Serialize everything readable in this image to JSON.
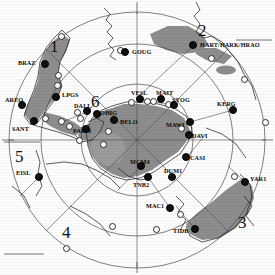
{
  "map": {
    "title": "Antarctic polar projection station map",
    "projection": "south-polar",
    "colors": {
      "plate_fill": "#8a8a8a",
      "plate_fill_light": "#9b9b9b",
      "coastline": "#2b2b2b",
      "graticule": "#555555",
      "station_filled": "#101010",
      "station_hollow": "#ffffff",
      "background": "#ffffff"
    },
    "region_numbers": [
      {
        "label": "1",
        "x": 50,
        "y": 38
      },
      {
        "label": "2",
        "x": 198,
        "y": 22
      },
      {
        "label": "3",
        "x": 238,
        "y": 214
      },
      {
        "label": "4",
        "x": 62,
        "y": 224
      },
      {
        "label": "5",
        "x": 15,
        "y": 148
      },
      {
        "label": "6",
        "x": 91,
        "y": 93
      }
    ],
    "stations": [
      {
        "name": "BRAZ",
        "x": 45,
        "y": 64,
        "type": "filled",
        "label_x": 18,
        "label_y": 60
      },
      {
        "name": "AREQ",
        "x": 22,
        "y": 105,
        "type": "filled",
        "label_x": 5,
        "label_y": 97
      },
      {
        "name": "SANT",
        "x": 34,
        "y": 121,
        "type": "filled",
        "label_x": 12,
        "label_y": 126
      },
      {
        "name": "LPGS",
        "x": 56,
        "y": 97,
        "type": "filled",
        "label_x": 62,
        "label_y": 92
      },
      {
        "name": "EISL",
        "x": 39,
        "y": 177,
        "type": "filled",
        "label_x": 16,
        "label_y": 170
      },
      {
        "name": "GOUG",
        "x": 125,
        "y": 52,
        "type": "filled",
        "label_x": 132,
        "label_y": 49
      },
      {
        "name": "HART/HARK/HRAO",
        "x": 193,
        "y": 45,
        "type": "filled",
        "label_x": 200,
        "label_y": 42
      },
      {
        "name": "KERG",
        "x": 233,
        "y": 110,
        "type": "filled",
        "label_x": 217,
        "label_y": 101
      },
      {
        "name": "VESL",
        "x": 140,
        "y": 99,
        "type": "filled",
        "label_x": 131,
        "label_y": 90
      },
      {
        "name": "MAIT",
        "x": 161,
        "y": 99,
        "type": "filled",
        "label_x": 156,
        "label_y": 90
      },
      {
        "name": "SYOG",
        "x": 174,
        "y": 105,
        "type": "filled",
        "label_x": 172,
        "label_y": 97
      },
      {
        "name": "MAWI",
        "x": 190,
        "y": 122,
        "type": "filled",
        "label_x": 166,
        "label_y": 122
      },
      {
        "name": "DAVI",
        "x": 189,
        "y": 135,
        "type": "filled",
        "label_x": 192,
        "label_y": 133
      },
      {
        "name": "BELO",
        "x": 114,
        "y": 120,
        "type": "filled",
        "label_x": 120,
        "label_y": 119
      },
      {
        "name": "DALL",
        "x": 87,
        "y": 111,
        "type": "filled",
        "label_x": 74,
        "label_y": 103
      },
      {
        "name": "OHIG",
        "x": 97,
        "y": 114,
        "type": "filled",
        "label_x": 100,
        "label_y": 110
      },
      {
        "name": "PALM",
        "x": 86,
        "y": 129,
        "type": "filled",
        "label_x": 73,
        "label_y": 128
      },
      {
        "name": "MCM4",
        "x": 141,
        "y": 166,
        "type": "filled",
        "label_x": 130,
        "label_y": 159
      },
      {
        "name": "TNB2",
        "x": 148,
        "y": 177,
        "type": "filled",
        "label_x": 133,
        "label_y": 182
      },
      {
        "name": "DUM1",
        "x": 172,
        "y": 177,
        "type": "filled",
        "label_x": 164,
        "label_y": 168
      },
      {
        "name": "CASI",
        "x": 186,
        "y": 157,
        "type": "filled",
        "label_x": 190,
        "label_y": 155
      },
      {
        "name": "MAC1",
        "x": 170,
        "y": 208,
        "type": "filled",
        "label_x": 146,
        "label_y": 203
      },
      {
        "name": "TIDB",
        "x": 195,
        "y": 229,
        "type": "filled",
        "label_x": 173,
        "label_y": 228
      },
      {
        "name": "YAR1",
        "x": 245,
        "y": 182,
        "type": "filled",
        "label_x": 250,
        "label_y": 176
      }
    ],
    "unlabeled_stations": [
      {
        "x": 61,
        "y": 36,
        "type": "hollow"
      },
      {
        "x": 58,
        "y": 75,
        "type": "hollow"
      },
      {
        "x": 57,
        "y": 85,
        "type": "hollow"
      },
      {
        "x": 45,
        "y": 118,
        "type": "hollow"
      },
      {
        "x": 61,
        "y": 121,
        "type": "hollow"
      },
      {
        "x": 69,
        "y": 126,
        "type": "hollow"
      },
      {
        "x": 77,
        "y": 112,
        "type": "hollow"
      },
      {
        "x": 80,
        "y": 118,
        "type": "hollow"
      },
      {
        "x": 79,
        "y": 140,
        "type": "hollow"
      },
      {
        "x": 108,
        "y": 131,
        "type": "hollow"
      },
      {
        "x": 131,
        "y": 102,
        "type": "hollow"
      },
      {
        "x": 147,
        "y": 101,
        "type": "hollow"
      },
      {
        "x": 153,
        "y": 101,
        "type": "hollow"
      },
      {
        "x": 168,
        "y": 104,
        "type": "hollow"
      },
      {
        "x": 181,
        "y": 128,
        "type": "hollow"
      },
      {
        "x": 211,
        "y": 58,
        "type": "hollow"
      },
      {
        "x": 244,
        "y": 79,
        "type": "hollow"
      },
      {
        "x": 234,
        "y": 176,
        "type": "hollow"
      },
      {
        "x": 180,
        "y": 214,
        "type": "hollow"
      },
      {
        "x": 156,
        "y": 229,
        "type": "hollow"
      },
      {
        "x": 112,
        "y": 226,
        "type": "hollow"
      },
      {
        "x": 66,
        "y": 248,
        "type": "hollow"
      },
      {
        "x": 103,
        "y": 144,
        "type": "hollow"
      },
      {
        "x": 120,
        "y": 50,
        "type": "hollow"
      },
      {
        "x": 265,
        "y": 122,
        "type": "hollow"
      }
    ]
  }
}
